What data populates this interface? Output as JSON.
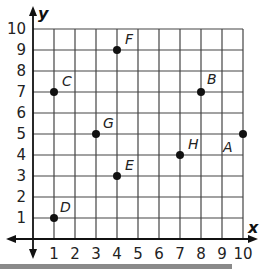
{
  "graph": {
    "x_axis_label": "x",
    "y_axis_label": "y",
    "x_ticks": [
      "1",
      "2",
      "3",
      "4",
      "5",
      "6",
      "7",
      "8",
      "9",
      "10"
    ],
    "y_ticks": [
      "1",
      "2",
      "3",
      "4",
      "5",
      "6",
      "7",
      "8",
      "9",
      "10"
    ],
    "grid_color": "#444444",
    "point_color": "#111111"
  },
  "points": [
    {
      "label": "A",
      "x": 10,
      "y": 5
    },
    {
      "label": "B",
      "x": 8,
      "y": 7
    },
    {
      "label": "C",
      "x": 1,
      "y": 7
    },
    {
      "label": "D",
      "x": 1,
      "y": 1
    },
    {
      "label": "E",
      "x": 4,
      "y": 3
    },
    {
      "label": "F",
      "x": 4,
      "y": 9
    },
    {
      "label": "G",
      "x": 3,
      "y": 5
    },
    {
      "label": "H",
      "x": 7,
      "y": 4
    }
  ]
}
